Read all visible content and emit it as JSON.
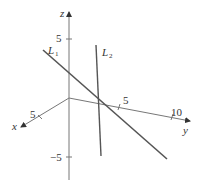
{
  "diagram": {
    "type": "3d-coordinate-axes-with-lines",
    "axes": {
      "x": {
        "label": "x",
        "ticks": [
          {
            "value": "5"
          }
        ]
      },
      "y": {
        "label": "y",
        "ticks": [
          {
            "value": "5"
          },
          {
            "value": "10"
          }
        ]
      },
      "z": {
        "label": "z",
        "ticks": [
          {
            "value": "5"
          },
          {
            "value": "−5"
          }
        ]
      }
    },
    "lines": [
      {
        "name": "L",
        "sub": "1"
      },
      {
        "name": "L",
        "sub": "2"
      }
    ],
    "colors": {
      "axis": "#666666",
      "line": "#555555",
      "text": "#333333"
    }
  }
}
